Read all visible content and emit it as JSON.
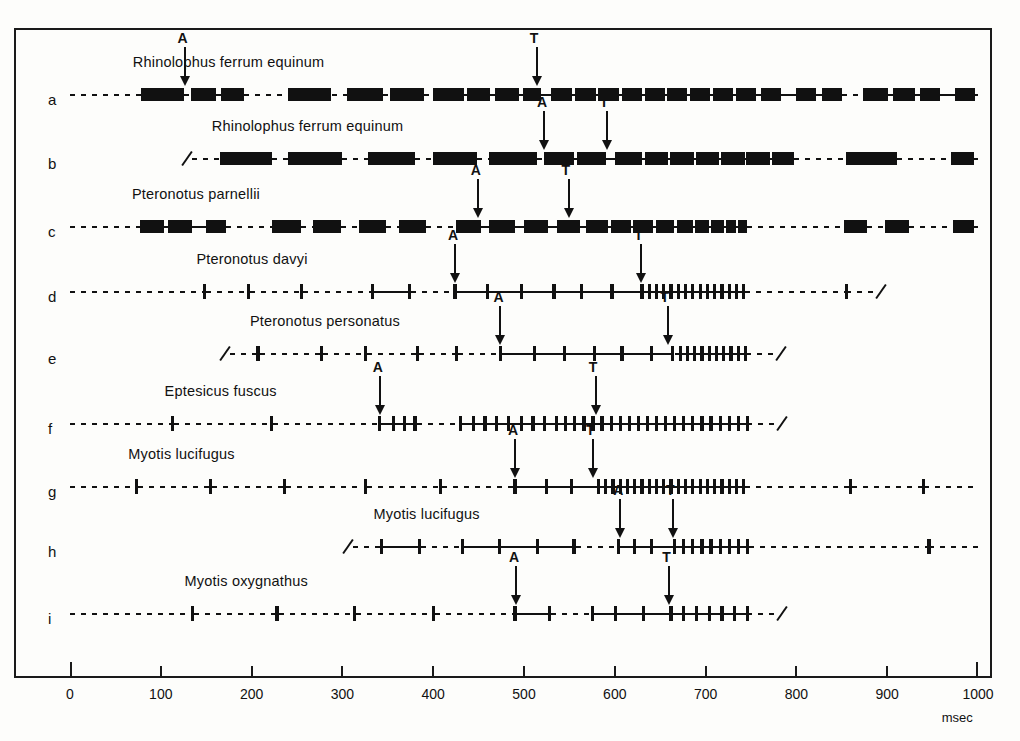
{
  "figure": {
    "axis": {
      "unit_label": "msec",
      "min": 0,
      "max": 1000,
      "tick_step": 100,
      "ticks": [
        "0",
        "100",
        "200",
        "300",
        "400",
        "500",
        "600",
        "700",
        "800",
        "900",
        "1000"
      ]
    },
    "marker_labels": {
      "approach": "A",
      "terminal": "T"
    },
    "colors": {
      "ink": "#111111",
      "background": "#fdfdfb"
    }
  },
  "chart_data": {
    "type": "line",
    "title": "",
    "xlabel": "msec",
    "ylabel": "",
    "xlim": [
      0,
      1000
    ],
    "grid": false,
    "legend": "none",
    "rows": [
      {
        "letter": "a",
        "species": "Rhinolophus ferrum equinum",
        "pulse_style": "wide",
        "start_break": false,
        "end_break": false,
        "markers": [
          {
            "label": "A",
            "x": 125
          },
          {
            "label": "T",
            "x": 513
          }
        ],
        "pulses": [
          {
            "x": 78,
            "w": 48
          },
          {
            "x": 133,
            "w": 28
          },
          {
            "x": 166,
            "w": 26
          },
          {
            "x": 240,
            "w": 48
          },
          {
            "x": 305,
            "w": 40
          },
          {
            "x": 352,
            "w": 38
          },
          {
            "x": 400,
            "w": 34
          },
          {
            "x": 437,
            "w": 26
          },
          {
            "x": 468,
            "w": 26
          },
          {
            "x": 499,
            "w": 20
          },
          {
            "x": 530,
            "w": 23
          },
          {
            "x": 556,
            "w": 23
          },
          {
            "x": 582,
            "w": 23
          },
          {
            "x": 608,
            "w": 22
          },
          {
            "x": 633,
            "w": 22
          },
          {
            "x": 658,
            "w": 22
          },
          {
            "x": 683,
            "w": 22
          },
          {
            "x": 708,
            "w": 22
          },
          {
            "x": 733,
            "w": 22
          },
          {
            "x": 761,
            "w": 22
          },
          {
            "x": 800,
            "w": 22
          },
          {
            "x": 828,
            "w": 22
          },
          {
            "x": 873,
            "w": 28
          },
          {
            "x": 906,
            "w": 25
          },
          {
            "x": 936,
            "w": 22
          },
          {
            "x": 975,
            "w": 22
          }
        ]
      },
      {
        "letter": "b",
        "species": "Rhinolophus ferrum equinum",
        "pulse_style": "wide",
        "start_break": true,
        "end_break": false,
        "markers": [
          {
            "label": "A",
            "x": 521
          },
          {
            "label": "T",
            "x": 590
          }
        ],
        "pulses": [
          {
            "x": 165,
            "w": 58
          },
          {
            "x": 240,
            "w": 60
          },
          {
            "x": 328,
            "w": 52
          },
          {
            "x": 400,
            "w": 48
          },
          {
            "x": 462,
            "w": 52
          },
          {
            "x": 522,
            "w": 33
          },
          {
            "x": 558,
            "w": 32
          },
          {
            "x": 600,
            "w": 30
          },
          {
            "x": 633,
            "w": 26
          },
          {
            "x": 661,
            "w": 26
          },
          {
            "x": 689,
            "w": 26
          },
          {
            "x": 717,
            "w": 26
          },
          {
            "x": 745,
            "w": 26
          },
          {
            "x": 773,
            "w": 24
          },
          {
            "x": 855,
            "w": 56
          },
          {
            "x": 970,
            "w": 26
          }
        ]
      },
      {
        "letter": "c",
        "species": "Pteronotus  parnellii",
        "pulse_style": "wide",
        "start_break": false,
        "end_break": false,
        "markers": [
          {
            "label": "A",
            "x": 448
          },
          {
            "label": "T",
            "x": 548
          }
        ],
        "pulses": [
          {
            "x": 77,
            "w": 26
          },
          {
            "x": 108,
            "w": 26
          },
          {
            "x": 150,
            "w": 22
          },
          {
            "x": 222,
            "w": 32
          },
          {
            "x": 268,
            "w": 30
          },
          {
            "x": 318,
            "w": 30
          },
          {
            "x": 362,
            "w": 30
          },
          {
            "x": 425,
            "w": 28
          },
          {
            "x": 462,
            "w": 28
          },
          {
            "x": 500,
            "w": 26
          },
          {
            "x": 536,
            "w": 26
          },
          {
            "x": 568,
            "w": 24
          },
          {
            "x": 596,
            "w": 22
          },
          {
            "x": 620,
            "w": 22
          },
          {
            "x": 645,
            "w": 20
          },
          {
            "x": 668,
            "w": 18
          },
          {
            "x": 688,
            "w": 16
          },
          {
            "x": 706,
            "w": 14
          },
          {
            "x": 722,
            "w": 12
          },
          {
            "x": 736,
            "w": 10
          },
          {
            "x": 852,
            "w": 26
          },
          {
            "x": 898,
            "w": 26
          },
          {
            "x": 972,
            "w": 24
          }
        ]
      },
      {
        "letter": "d",
        "species": "Pteronotus davyi",
        "pulse_style": "narrow",
        "start_break": false,
        "end_break": true,
        "markers": [
          {
            "label": "A",
            "x": 423
          },
          {
            "label": "T",
            "x": 628
          }
        ],
        "pulses": [
          {
            "x": 148
          },
          {
            "x": 197
          },
          {
            "x": 255
          },
          {
            "x": 333
          },
          {
            "x": 374
          },
          {
            "x": 424
          },
          {
            "x": 460
          },
          {
            "x": 497
          },
          {
            "x": 533
          },
          {
            "x": 563
          },
          {
            "x": 597
          },
          {
            "x": 630
          },
          {
            "x": 638
          },
          {
            "x": 646
          },
          {
            "x": 654
          },
          {
            "x": 662
          },
          {
            "x": 670
          },
          {
            "x": 678
          },
          {
            "x": 686
          },
          {
            "x": 694
          },
          {
            "x": 702
          },
          {
            "x": 710
          },
          {
            "x": 718
          },
          {
            "x": 726
          },
          {
            "x": 734
          },
          {
            "x": 742
          },
          {
            "x": 855
          }
        ]
      },
      {
        "letter": "e",
        "species": "Pteronotus personatus",
        "pulse_style": "narrow",
        "start_break": true,
        "end_break": true,
        "markers": [
          {
            "label": "A",
            "x": 473
          },
          {
            "label": "T",
            "x": 657
          }
        ],
        "pulses": [
          {
            "x": 207
          },
          {
            "x": 277
          },
          {
            "x": 325
          },
          {
            "x": 383
          },
          {
            "x": 426
          },
          {
            "x": 474
          },
          {
            "x": 512
          },
          {
            "x": 545
          },
          {
            "x": 578
          },
          {
            "x": 608
          },
          {
            "x": 640
          },
          {
            "x": 664
          },
          {
            "x": 672
          },
          {
            "x": 680
          },
          {
            "x": 688
          },
          {
            "x": 696
          },
          {
            "x": 704
          },
          {
            "x": 712
          },
          {
            "x": 720
          },
          {
            "x": 728
          },
          {
            "x": 736
          },
          {
            "x": 744
          }
        ]
      },
      {
        "letter": "f",
        "species": "Eptesicus fuscus",
        "pulse_style": "narrow",
        "start_break": false,
        "end_break": true,
        "markers": [
          {
            "label": "A",
            "x": 340
          },
          {
            "label": "T",
            "x": 578
          }
        ],
        "pulses": [
          {
            "x": 113
          },
          {
            "x": 222
          },
          {
            "x": 341
          },
          {
            "x": 356
          },
          {
            "x": 368
          },
          {
            "x": 380
          },
          {
            "x": 430
          },
          {
            "x": 444
          },
          {
            "x": 457
          },
          {
            "x": 470
          },
          {
            "x": 483
          },
          {
            "x": 497
          },
          {
            "x": 510
          },
          {
            "x": 523
          },
          {
            "x": 536
          },
          {
            "x": 546
          },
          {
            "x": 556
          },
          {
            "x": 566
          },
          {
            "x": 576
          },
          {
            "x": 586
          },
          {
            "x": 596
          },
          {
            "x": 606
          },
          {
            "x": 616
          },
          {
            "x": 626
          },
          {
            "x": 636
          },
          {
            "x": 646
          },
          {
            "x": 656
          },
          {
            "x": 666
          },
          {
            "x": 676
          },
          {
            "x": 686
          },
          {
            "x": 696
          },
          {
            "x": 706
          },
          {
            "x": 716
          },
          {
            "x": 726
          },
          {
            "x": 736
          },
          {
            "x": 746
          }
        ]
      },
      {
        "letter": "g",
        "species": "Myotis lucifugus",
        "pulse_style": "narrow",
        "start_break": false,
        "end_break": false,
        "markers": [
          {
            "label": "A",
            "x": 489
          },
          {
            "label": "T",
            "x": 575
          }
        ],
        "pulses": [
          {
            "x": 73
          },
          {
            "x": 155
          },
          {
            "x": 236
          },
          {
            "x": 325
          },
          {
            "x": 408
          },
          {
            "x": 490
          },
          {
            "x": 525
          },
          {
            "x": 552
          },
          {
            "x": 582
          },
          {
            "x": 590
          },
          {
            "x": 598
          },
          {
            "x": 606
          },
          {
            "x": 614
          },
          {
            "x": 622
          },
          {
            "x": 630
          },
          {
            "x": 638
          },
          {
            "x": 646
          },
          {
            "x": 654
          },
          {
            "x": 662
          },
          {
            "x": 670
          },
          {
            "x": 678
          },
          {
            "x": 686
          },
          {
            "x": 694
          },
          {
            "x": 702
          },
          {
            "x": 710
          },
          {
            "x": 718
          },
          {
            "x": 726
          },
          {
            "x": 734
          },
          {
            "x": 742
          },
          {
            "x": 860
          },
          {
            "x": 940
          }
        ]
      },
      {
        "letter": "h",
        "species": "Myotis lucifugus",
        "pulse_style": "narrow",
        "start_break": true,
        "end_break": false,
        "markers": [
          {
            "label": "A",
            "x": 605
          },
          {
            "label": "T",
            "x": 663
          }
        ],
        "pulses": [
          {
            "x": 343
          },
          {
            "x": 385
          },
          {
            "x": 432
          },
          {
            "x": 473
          },
          {
            "x": 515
          },
          {
            "x": 555
          },
          {
            "x": 604
          },
          {
            "x": 622
          },
          {
            "x": 640
          },
          {
            "x": 666
          },
          {
            "x": 676
          },
          {
            "x": 686
          },
          {
            "x": 696
          },
          {
            "x": 706
          },
          {
            "x": 716
          },
          {
            "x": 726
          },
          {
            "x": 736
          },
          {
            "x": 746
          },
          {
            "x": 946
          }
        ]
      },
      {
        "letter": "i",
        "species": "Myotis oxygnathus",
        "pulse_style": "narrow",
        "start_break": false,
        "end_break": true,
        "markers": [
          {
            "label": "A",
            "x": 490
          },
          {
            "label": "T",
            "x": 659
          }
        ],
        "pulses": [
          {
            "x": 135
          },
          {
            "x": 228
          },
          {
            "x": 313
          },
          {
            "x": 400
          },
          {
            "x": 490
          },
          {
            "x": 528
          },
          {
            "x": 575
          },
          {
            "x": 601
          },
          {
            "x": 632
          },
          {
            "x": 662
          },
          {
            "x": 676
          },
          {
            "x": 690
          },
          {
            "x": 704
          },
          {
            "x": 718
          },
          {
            "x": 732
          },
          {
            "x": 746
          }
        ]
      }
    ]
  }
}
